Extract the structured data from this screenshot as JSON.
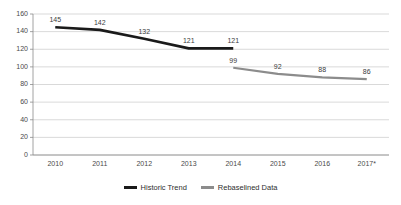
{
  "chart_data": {
    "type": "line",
    "title": "",
    "xlabel": "",
    "ylabel": "",
    "categories": [
      "2010",
      "2011",
      "2012",
      "2013",
      "2014",
      "2015",
      "2016",
      "2017*"
    ],
    "ylim": [
      0,
      160
    ],
    "yticks": [
      0,
      20,
      40,
      60,
      80,
      100,
      120,
      140,
      160
    ],
    "ytick_labels": [
      "0",
      "20",
      "40",
      "60",
      "80",
      "100",
      "120",
      "140",
      "160"
    ],
    "grid": true,
    "legend_position": "bottom-center",
    "series": [
      {
        "name": "Historic Trend",
        "color": "#1a1a1a",
        "x": [
          "2010",
          "2011",
          "2012",
          "2013",
          "2014"
        ],
        "values": [
          145,
          142,
          132,
          121,
          121
        ],
        "labels": [
          "145",
          "142",
          "132",
          "121",
          "121"
        ]
      },
      {
        "name": "Rebaselined Data",
        "color": "#8c8c8c",
        "x": [
          "2014",
          "2015",
          "2016",
          "2017*"
        ],
        "values": [
          99,
          92,
          88,
          86
        ],
        "labels": [
          "99",
          "92",
          "88",
          "86"
        ]
      }
    ]
  },
  "legend": {
    "items": [
      {
        "label": "Historic Trend",
        "color": "#1a1a1a"
      },
      {
        "label": "Rebaselined Data",
        "color": "#8c8c8c"
      }
    ]
  },
  "colors": {
    "historic_trend": "#1a1a1a",
    "rebaselined_data": "#8c8c8c",
    "gridline": "#c9c9c9",
    "axis": "#8c8c8c",
    "tick_text": "#4a4a4a",
    "background": "#ffffff"
  }
}
